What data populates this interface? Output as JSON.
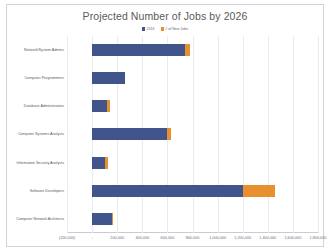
{
  "chart_data": {
    "type": "bar",
    "orientation": "horizontal",
    "stacked": true,
    "title": "Projected Number of Jobs by 2026",
    "xlabel": "",
    "ylabel": "",
    "xlim": [
      -200000,
      1800000
    ],
    "grid": true,
    "legend_position": "top-center",
    "categories": [
      "Network/System Admins",
      "Computer Programmers",
      "Database Administrators",
      "Computer Systems Analysts",
      "Information Security Analysts",
      "Software Developers",
      "Computer Network Architects"
    ],
    "series": [
      {
        "name": "2016",
        "color": "#41558C",
        "values": [
          740000,
          260000,
          120000,
          600000,
          100000,
          1200000,
          160000
        ]
      },
      {
        "name": "# of New Jobs",
        "color": "#E8902E",
        "values": [
          40000,
          0,
          20000,
          30000,
          30000,
          260000,
          10000
        ]
      }
    ],
    "tick_labels": [
      "(200,000)",
      "-",
      "200,000",
      "400,000",
      "600,000",
      "800,000",
      "1,000,000",
      "1,200,000",
      "1,400,000",
      "1,600,000",
      "1,800,000"
    ],
    "tick_values": [
      -200000,
      0,
      200000,
      400000,
      600000,
      800000,
      1000000,
      1200000,
      1400000,
      1600000,
      1800000
    ]
  },
  "colors": {
    "base_series": "#41558C",
    "new_series": "#E8902E",
    "gridline": "#e8ecf1",
    "title_text": "#5a5a5a",
    "label_text": "#555a60",
    "chart_border": "#d0d4da",
    "background": "#ffffff"
  }
}
